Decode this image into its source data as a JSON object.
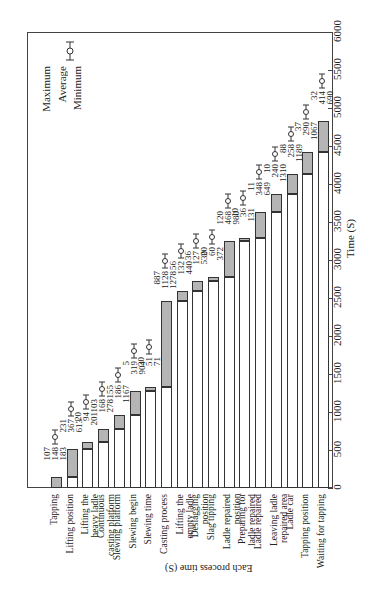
{
  "chart_data": {
    "type": "bar",
    "orientation": "stacked-gantt, rendered rotated 90 degrees",
    "title": "",
    "xlabel": "Time (S)",
    "ylabel": "Each process time (S)",
    "xlim": [
      0,
      6000
    ],
    "xticks": [
      0,
      500,
      1000,
      1500,
      2000,
      2500,
      3000,
      3500,
      4000,
      4500,
      5000,
      5500,
      6000
    ],
    "legend": {
      "position": "top-left",
      "entries": [
        "Maximum",
        "Average",
        "Minimum"
      ]
    },
    "categories": [
      "Tapping",
      "Lifting position",
      "Lifting the\nheavy ladle",
      "Continuous\ncasting platform",
      "Slewing platform",
      "Slewing begin",
      "Slewing time",
      "Casting process",
      "Lifting the\nempty ladle",
      "Deslagging\nposition",
      "Slag tipping",
      "Ladle repaired\nposition",
      "Preparing for\nladle repaired",
      "Ladle repaired",
      "Leaving ladle\nrepaired area",
      "Ladle car",
      "Tapping position",
      "Waiting for tapping"
    ],
    "series": [
      {
        "name": "Start time (white)",
        "values": [
          0,
          148,
          515,
          609,
          777,
          963,
          1282,
          1333,
          2461,
          2593,
          2720,
          2780,
          3248,
          3284,
          3632,
          3872,
          4130,
          4420
        ]
      },
      {
        "name": "Average duration (gray)",
        "values": [
          148,
          367,
          94,
          168,
          186,
          319,
          51,
          1128,
          132,
          127,
          60,
          468,
          36,
          348,
          240,
          258,
          290,
          414
        ]
      }
    ],
    "annotations": [
      {
        "category": "Tapping",
        "max": 183,
        "avg": 148,
        "min": 107
      },
      {
        "category": "Lifting position",
        "max": 613,
        "avg": 367,
        "min": 231
      },
      {
        "category": "Lifting the heavy ladle",
        "max": 201,
        "avg": 94,
        "min": 20
      },
      {
        "category": "Continuous casting platform",
        "max": 278,
        "avg": 168,
        "min": 103
      },
      {
        "category": "Slewing platform",
        "max": 1167,
        "avg": 186,
        "min": 155
      },
      {
        "category": "Slewing begin",
        "max": 904,
        "avg": 319,
        "min": 5
      },
      {
        "category": "Slewing time",
        "max": 71,
        "avg": 51,
        "min": 30
      },
      {
        "category": "Casting process",
        "max": 1278,
        "avg": 1128,
        "min": 887
      },
      {
        "category": "Lifting the empty ladle",
        "max": 440,
        "avg": 132,
        "min": 56
      },
      {
        "category": "Deslagging position",
        "max": 530,
        "avg": 127,
        "min": 36
      },
      {
        "category": "Slag tipping",
        "max": 372,
        "avg": 60,
        "min": 20
      },
      {
        "category": "Ladle repaired position",
        "max": 980,
        "avg": 468,
        "min": 120
      },
      {
        "category": "Preparing for ladle repaired",
        "max": 131,
        "avg": 36,
        "min": 10
      },
      {
        "category": "Ladle repaired",
        "max": 649,
        "avg": 348,
        "min": 11
      },
      {
        "category": "Leaving ladle repaired area",
        "max": 1310,
        "avg": 240,
        "min": 10
      },
      {
        "category": "Ladle car",
        "max": 1189,
        "avg": 258,
        "min": 88
      },
      {
        "category": "Tapping position",
        "max": 1067,
        "avg": 290,
        "min": 37
      },
      {
        "category": "Waiting for tapping",
        "max": 690,
        "avg": 414,
        "min": 32
      }
    ],
    "grid": false,
    "colors": {
      "start": "#ffffff",
      "duration": "#b5b5b5",
      "outline": "#333333"
    }
  }
}
